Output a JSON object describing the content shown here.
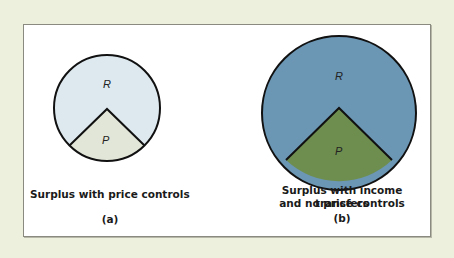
{
  "figure": {
    "panel_a": {
      "caption": "Surplus with price controls",
      "label": "(a)",
      "regions": {
        "R": "R",
        "P": "P"
      },
      "colors": {
        "R": "#dde9ef",
        "P": "#e2e6d8"
      }
    },
    "panel_b": {
      "caption_line1": "Surplus with income transfers",
      "caption_line2": "and no price controls",
      "label": "(b)",
      "regions": {
        "R": "R",
        "P": "P"
      },
      "colors": {
        "R": "#6b96b4",
        "P": "#6e8e50"
      }
    }
  }
}
